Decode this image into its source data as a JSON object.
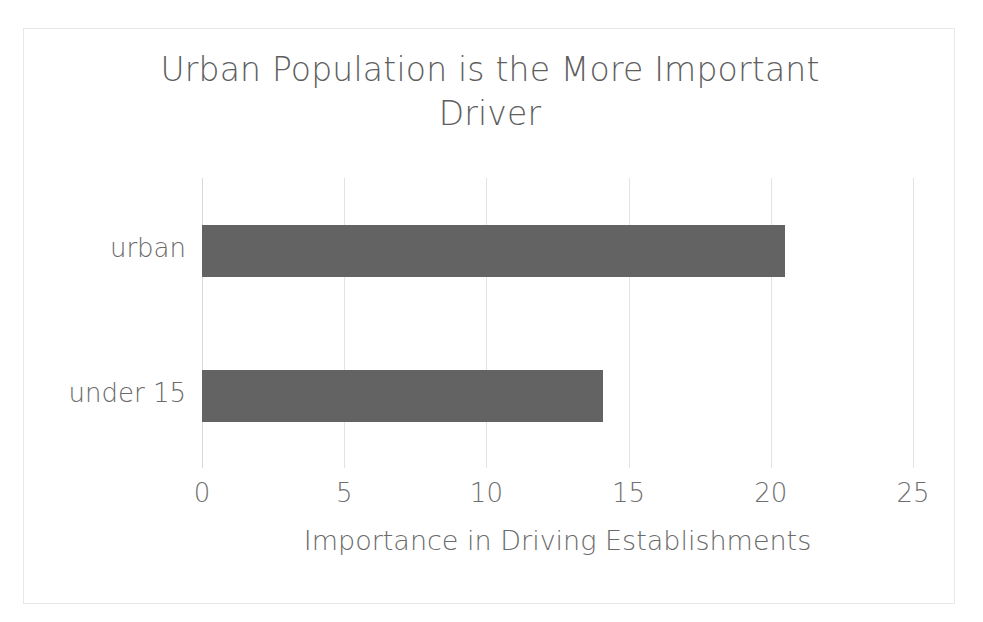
{
  "chart_data": {
    "type": "bar",
    "orientation": "horizontal",
    "title": "Urban Population is the More Important\nDriver",
    "title_line1": "Urban Population is the More Important",
    "title_line2": "Driver",
    "categories": [
      "urban",
      "under 15"
    ],
    "values": [
      20.5,
      14.1
    ],
    "series": [
      {
        "name": "Importance in Driving Establishments",
        "values": [
          20.5,
          14.1
        ]
      }
    ],
    "xlabel": "Importance in Driving Establishments",
    "ylabel": "",
    "xlim": [
      0,
      25
    ],
    "xticks": [
      0,
      5,
      10,
      15,
      20,
      25
    ],
    "xtick_labels": [
      "0",
      "5",
      "10",
      "15",
      "20",
      "25"
    ],
    "grid": "vertical",
    "legend": false,
    "bar_color": "#636363",
    "grid_color": "#e3e3e3",
    "text_color": "#6a6a6a",
    "background": "#ffffff"
  }
}
